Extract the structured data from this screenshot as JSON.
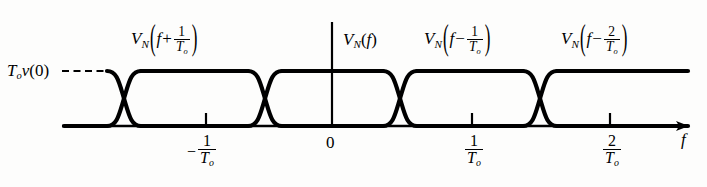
{
  "figure": {
    "kind": "overlapping-spectra-diagram",
    "stroke_color": "#000000",
    "background_color": "#fdfdfc"
  },
  "axes": {
    "x_axis_label": "f",
    "origin_label": "0",
    "y_reference_label": {
      "T": "T",
      "T_sub": "o",
      "v": "v",
      "arg": "(0)"
    },
    "ticks": [
      {
        "id": "tick-neg-1-over-T0",
        "sign": "−",
        "numerator": "1",
        "denominator": "T",
        "den_sub": "o",
        "x": 206
      },
      {
        "id": "tick-origin",
        "sign": "",
        "numerator": "0",
        "denominator": "",
        "den_sub": "",
        "x": 332
      },
      {
        "id": "tick-pos-1-over-T0",
        "sign": "",
        "numerator": "1",
        "denominator": "T",
        "den_sub": "o",
        "x": 472
      },
      {
        "id": "tick-pos-2-over-T0",
        "sign": "",
        "numerator": "2",
        "denominator": "T",
        "den_sub": "o",
        "x": 610
      }
    ]
  },
  "curve_labels": [
    {
      "id": "label-vn-f-plus-1-T0",
      "v": "V",
      "v_sub": "N",
      "arg_var": "f",
      "op": "+",
      "numerator": "1",
      "denominator": "T",
      "den_sub": "o",
      "x": 131,
      "y": 27
    },
    {
      "id": "label-vn-f",
      "v": "V",
      "v_sub": "N",
      "arg_var": "f",
      "op": "",
      "numerator": "",
      "denominator": "",
      "den_sub": "",
      "x": 343,
      "y": 33
    },
    {
      "id": "label-vn-f-minus-1-T0",
      "v": "V",
      "v_sub": "N",
      "arg_var": "f",
      "op": "−",
      "numerator": "1",
      "denominator": "T",
      "den_sub": "o",
      "x": 424,
      "y": 27
    },
    {
      "id": "label-vn-f-minus-2-T0",
      "v": "V",
      "v_sub": "N",
      "arg_var": "f",
      "op": "−",
      "numerator": "2",
      "denominator": "T",
      "den_sub": "o",
      "x": 561,
      "y": 27
    }
  ],
  "geometry": {
    "baseline_y": 126,
    "top_y": 71,
    "axis_x_start": 62,
    "axis_x_end": 690,
    "vertical_axis_x": 332,
    "vertical_axis_top": 22,
    "dashed_from_x": 62,
    "dashed_to_x": 110,
    "crossover_centers": [
      124,
      265,
      400,
      540
    ],
    "crossover_half_width": 17
  }
}
